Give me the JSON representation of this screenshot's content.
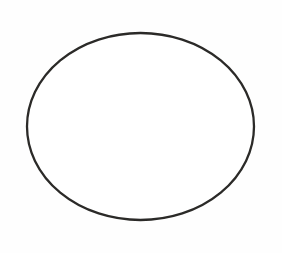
{
  "canvas": {
    "width": 282,
    "height": 253,
    "background_color": "#fefefe",
    "description": "Blank white page containing a single hand-drawn ellipse outline"
  },
  "figure": {
    "name": "ellipse-outline",
    "type": "ellipse",
    "label": "",
    "fill": "none",
    "fill_color": "#ffffff",
    "stroke_color": "#2b2a28",
    "stroke_width": 2.3,
    "center_x": 140.5,
    "center_y": 126.5,
    "radius_x": 113.5,
    "radius_y": 93.5,
    "bounds": {
      "left": 27,
      "top": 33,
      "right": 254,
      "bottom": 220,
      "width": 227,
      "height": 187
    },
    "rotation_degrees": 0,
    "interior_content": ""
  },
  "annotations": [],
  "text_elements": []
}
